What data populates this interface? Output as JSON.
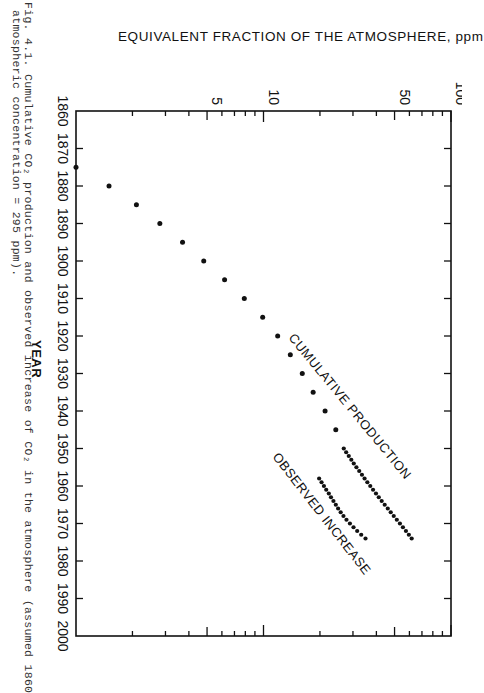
{
  "caption": {
    "line1": "Fig. 4.1. Cumulative CO₂ production and observed increase of CO₂ in the atmosphere (assumed 1860",
    "line2": "atmospheric concentration = 295 ppm)."
  },
  "chart_data": {
    "type": "scatter",
    "title": "",
    "orientation": "rotated 90 degrees (years run top-to-bottom, ppm runs left-to-right)",
    "xlabel": "YEAR",
    "ylabel": "EQUIVALENT FRACTION OF THE ATMOSPHERE, ppm",
    "xlim": [
      1860,
      2000
    ],
    "ylim": [
      1,
      100
    ],
    "yscale": "log",
    "x_ticks": [
      1860,
      1870,
      1880,
      1890,
      1900,
      1910,
      1920,
      1930,
      1940,
      1950,
      1960,
      1970,
      1980,
      1990,
      2000
    ],
    "y_tick_labels": [
      "5",
      "10",
      "50",
      "100"
    ],
    "y_ticks_minor": [
      2,
      3,
      4,
      5,
      6,
      7,
      8,
      9,
      10,
      20,
      30,
      40,
      50,
      60,
      70,
      80,
      90,
      100
    ],
    "grid": false,
    "legend": "none (inline labels)",
    "annotations": [
      "CUMULATIVE PRODUCTION",
      "OBSERVED INCREASE"
    ],
    "series": [
      {
        "name": "CUMULATIVE PRODUCTION",
        "x": [
          1875,
          1880,
          1885,
          1890,
          1895,
          1900,
          1905,
          1910,
          1915,
          1920,
          1925,
          1930,
          1935,
          1940,
          1945,
          1950,
          1951,
          1952,
          1953,
          1954,
          1955,
          1956,
          1957,
          1958,
          1959,
          1960,
          1961,
          1962,
          1963,
          1964,
          1965,
          1966,
          1967,
          1968,
          1969,
          1970,
          1971,
          1972,
          1973,
          1974
        ],
        "values": [
          1.0,
          1.5,
          2.1,
          2.8,
          3.7,
          4.8,
          6.2,
          7.9,
          9.9,
          11.9,
          13.9,
          16.1,
          18.4,
          21.3,
          24.3,
          26.8,
          27.6,
          28.5,
          29.4,
          30.3,
          31.3,
          32.4,
          33.5,
          34.6,
          35.8,
          37.1,
          38.4,
          39.8,
          41.2,
          42.7,
          44.3,
          46.0,
          47.7,
          49.5,
          51.4,
          53.4,
          55.4,
          57.5,
          59.6,
          61.7
        ]
      },
      {
        "name": "OBSERVED INCREASE",
        "x": [
          1958,
          1959,
          1960,
          1961,
          1962,
          1963,
          1964,
          1965,
          1966,
          1967,
          1968,
          1969,
          1970,
          1971,
          1972,
          1973,
          1974
        ],
        "values": [
          19.8,
          20.4,
          21.0,
          21.6,
          22.3,
          22.9,
          23.6,
          24.3,
          25.0,
          25.8,
          26.7,
          27.7,
          28.9,
          30.2,
          31.6,
          33.2,
          35.0
        ]
      }
    ]
  }
}
